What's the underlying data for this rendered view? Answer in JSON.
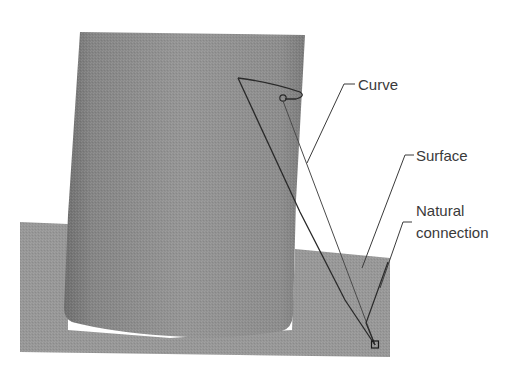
{
  "figure": {
    "colors": {
      "background": "#ffffff",
      "plane": "#979797",
      "cylinder_light": "#939393",
      "cylinder_dark": "#707070",
      "line": "#2a2a2a",
      "leader": "#3a3a3a",
      "text": "#3a3a3a"
    },
    "labels": {
      "curve": "Curve",
      "surface": "Surface",
      "natural_line1": "Natural",
      "natural_line2": "connection"
    }
  }
}
